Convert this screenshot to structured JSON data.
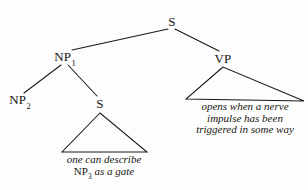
{
  "diagram": {
    "type": "syntax-tree",
    "title": "",
    "ink_color": "#15150f",
    "background_color": "#fdfdfd",
    "nodes": [
      {
        "id": "root-s",
        "label": "S",
        "subscript": "",
        "x": 172,
        "y": 22
      },
      {
        "id": "np1",
        "label": "NP",
        "subscript": "1",
        "x": 65,
        "y": 58
      },
      {
        "id": "vp",
        "label": "VP",
        "subscript": "",
        "x": 223,
        "y": 59
      },
      {
        "id": "np2",
        "label": "NP",
        "subscript": "2",
        "x": 20,
        "y": 101
      },
      {
        "id": "s-lower",
        "label": "S",
        "subscript": "",
        "x": 100,
        "y": 104
      }
    ],
    "triangles": [
      {
        "id": "vp-triangle",
        "apex_x": 223,
        "apex_y": 67,
        "left_x": 186,
        "left_y": 99,
        "right_x": 304,
        "right_y": 101
      },
      {
        "id": "s-triangle",
        "apex_x": 100,
        "apex_y": 113,
        "left_x": 62,
        "left_y": 152,
        "right_x": 147,
        "right_y": 152
      }
    ],
    "branches": [
      {
        "id": "s-to-np1",
        "x1": 168,
        "y1": 29,
        "x2": 72,
        "y2": 50
      },
      {
        "id": "s-to-vp",
        "x1": 175,
        "y1": 29,
        "x2": 219,
        "y2": 51
      },
      {
        "id": "np1-to-np2",
        "x1": 61,
        "y1": 65,
        "x2": 24,
        "y2": 93
      },
      {
        "id": "np1-to-s",
        "x1": 68,
        "y1": 65,
        "x2": 97,
        "y2": 96
      }
    ],
    "glosses": [
      {
        "id": "s-gloss",
        "center_x": 104,
        "top_y": 154,
        "lines": [
          [
            {
              "text": "one can describe",
              "style": "italic"
            }
          ],
          [
            {
              "text": "NP",
              "style": "roman"
            },
            {
              "text": "3",
              "style": "roman-sub"
            },
            {
              "text": " as a gate",
              "style": "italic"
            }
          ]
        ],
        "plain_text": "one can describe NP3 as a gate"
      },
      {
        "id": "vp-gloss",
        "center_x": 245,
        "top_y": 101,
        "lines": [
          [
            {
              "text": "opens when a nerve",
              "style": "italic"
            }
          ],
          [
            {
              "text": "impulse has been",
              "style": "italic"
            }
          ],
          [
            {
              "text": "triggered in some way",
              "style": "italic"
            }
          ]
        ],
        "plain_text": "opens when a nerve impulse has been triggered in some way"
      }
    ]
  }
}
